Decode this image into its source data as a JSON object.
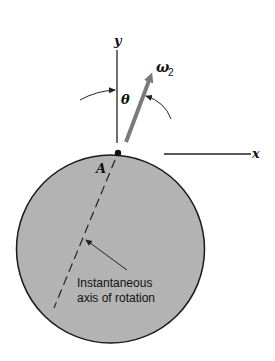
{
  "diagram": {
    "type": "rigid-body-rotation",
    "labels": {
      "y_axis": "y",
      "x_axis": "x",
      "angle": "θ",
      "angular_velocity": "ω",
      "angular_velocity_subscript": "2",
      "point": "A",
      "annotation_line1": "Instantaneous",
      "annotation_line2": "axis of rotation"
    },
    "colors": {
      "disk_fill": "#b3b3b3",
      "disk_stroke": "#1a1a1a",
      "vector": "#7a7a7a",
      "lines": "#222222",
      "background": "#ffffff"
    }
  }
}
